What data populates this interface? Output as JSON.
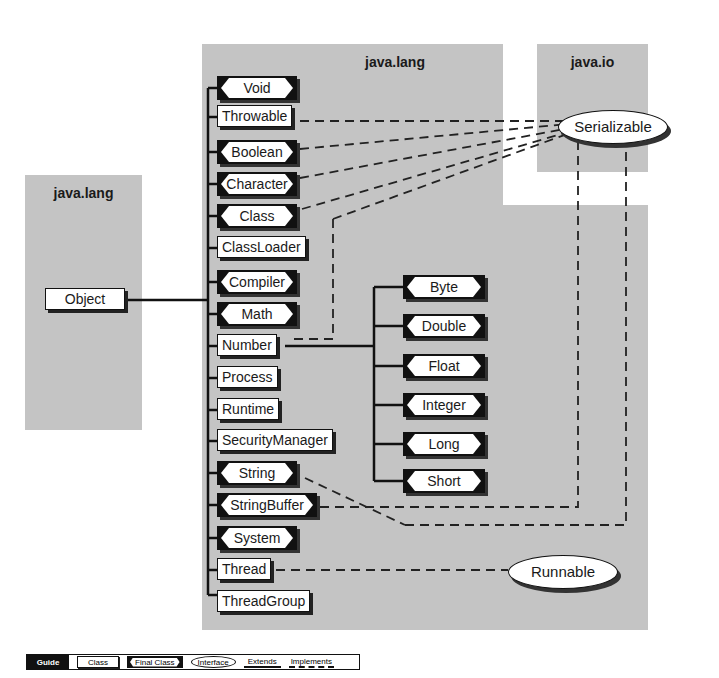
{
  "packages": {
    "left": {
      "title": "java.lang"
    },
    "main": {
      "title": "java.lang"
    },
    "io": {
      "title": "java.io"
    }
  },
  "root_class": {
    "label": "Object",
    "kind": "class"
  },
  "java_lang_members": [
    {
      "label": "Void",
      "kind": "final"
    },
    {
      "label": "Throwable",
      "kind": "class"
    },
    {
      "label": "Boolean",
      "kind": "final"
    },
    {
      "label": "Character",
      "kind": "final"
    },
    {
      "label": "Class",
      "kind": "final"
    },
    {
      "label": "ClassLoader",
      "kind": "class"
    },
    {
      "label": "Compiler",
      "kind": "final"
    },
    {
      "label": "Math",
      "kind": "final"
    },
    {
      "label": "Number",
      "kind": "class"
    },
    {
      "label": "Process",
      "kind": "class"
    },
    {
      "label": "Runtime",
      "kind": "class"
    },
    {
      "label": "SecurityManager",
      "kind": "class"
    },
    {
      "label": "String",
      "kind": "final"
    },
    {
      "label": "StringBuffer",
      "kind": "final"
    },
    {
      "label": "System",
      "kind": "final"
    },
    {
      "label": "Thread",
      "kind": "class"
    },
    {
      "label": "ThreadGroup",
      "kind": "class"
    }
  ],
  "number_subclasses": [
    {
      "label": "Byte",
      "kind": "final"
    },
    {
      "label": "Double",
      "kind": "final"
    },
    {
      "label": "Float",
      "kind": "final"
    },
    {
      "label": "Integer",
      "kind": "final"
    },
    {
      "label": "Long",
      "kind": "final"
    },
    {
      "label": "Short",
      "kind": "final"
    }
  ],
  "interfaces": {
    "serializable": {
      "label": "Serializable"
    },
    "runnable": {
      "label": "Runnable"
    }
  },
  "implements_relations": [
    {
      "from": "Throwable",
      "to": "Serializable"
    },
    {
      "from": "Boolean",
      "to": "Serializable"
    },
    {
      "from": "Character",
      "to": "Serializable"
    },
    {
      "from": "Class",
      "to": "Serializable"
    },
    {
      "from": "Number",
      "to": "Serializable"
    },
    {
      "from": "String",
      "to": "Serializable"
    },
    {
      "from": "StringBuffer",
      "to": "Serializable"
    },
    {
      "from": "Thread",
      "to": "Runnable"
    }
  ],
  "guide": {
    "title": "Guide",
    "class_label": "Class",
    "final_label": "Final Class",
    "interface_label": "Interface",
    "extends_label": "Extends",
    "implements_label": "Implements"
  },
  "colors": {
    "package_bg": "#c4c4c4",
    "line": "#111111",
    "box_bg": "#ffffff"
  }
}
